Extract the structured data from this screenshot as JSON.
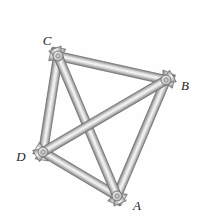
{
  "figure": {
    "name": "space-truss-tetrahedron-diagram",
    "background_color": "#fefefe",
    "canvas": {
      "width": 202,
      "height": 220
    },
    "bar": {
      "width": 9,
      "stub_overshoot": 8,
      "flare_extra_halfwidth": 2.2,
      "outline_color": "#6f6f6f",
      "gradient": [
        "#808080",
        "#b2b2b2",
        "#e9e9e9",
        "#f3f3f3",
        "#c5c5c5",
        "#7e7e7e"
      ]
    },
    "hub": {
      "outer_radius": 5,
      "inner_radius": 2.2,
      "outer_stroke": "#6f6f6f",
      "inner_stroke": "#7a7a7a",
      "inner_fill": "#c9c9c9",
      "radial_gradient": [
        "#efefef",
        "#d2d2d2",
        "#9f9f9f"
      ]
    },
    "label_color": "#1e1e1e",
    "joints": [
      {
        "id": "C",
        "x": 58,
        "y": 56,
        "label": "C",
        "label_x": 47,
        "label_y": 45
      },
      {
        "id": "B",
        "x": 166,
        "y": 80,
        "label": "B",
        "label_x": 185,
        "label_y": 90
      },
      {
        "id": "D",
        "x": 43,
        "y": 152,
        "label": "D",
        "label_x": 21,
        "label_y": 161
      },
      {
        "id": "A",
        "x": 117,
        "y": 196,
        "label": "A",
        "label_x": 137,
        "label_y": 210
      }
    ],
    "members": [
      {
        "from": "C",
        "to": "D"
      },
      {
        "from": "B",
        "to": "A"
      },
      {
        "from": "D",
        "to": "A"
      },
      {
        "from": "C",
        "to": "B"
      },
      {
        "from": "C",
        "to": "A"
      },
      {
        "from": "D",
        "to": "B"
      }
    ]
  }
}
